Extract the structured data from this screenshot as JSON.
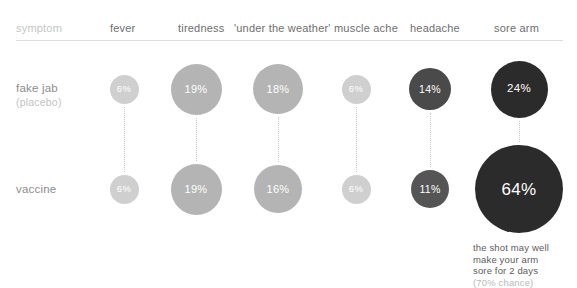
{
  "chart_data": {
    "type": "bar",
    "title": "",
    "subtitle": "",
    "xlabel": "",
    "ylabel": "",
    "legend_position": "left",
    "grid": false,
    "row_header": "symptom",
    "categories": [
      "fever",
      "tiredness",
      "'under the weather'",
      "muscle ache",
      "headache",
      "sore arm"
    ],
    "series": [
      {
        "name": "fake jab",
        "sublabel": "(placebo)",
        "values": [
          6,
          19,
          18,
          6,
          14,
          24
        ],
        "labels": [
          "6%",
          "19%",
          "18%",
          "6%",
          "14%",
          "24%"
        ]
      },
      {
        "name": "vaccine",
        "sublabel": "",
        "values": [
          6,
          19,
          16,
          6,
          11,
          64
        ],
        "labels": [
          "6%",
          "19%",
          "16%",
          "6%",
          "11%",
          "64%"
        ]
      }
    ],
    "units": "percent",
    "annotation": {
      "lines": [
        "the shot may well",
        "make your arm",
        "sore for 2 days"
      ],
      "note": "(70% chance)"
    }
  },
  "colors": {
    "background": "#ffffff",
    "rule": "#dcdcdc",
    "header_text": "#6e6e6e",
    "header_muted": "#c4c4c4",
    "row_label": "#8d8d8d",
    "row_sublabel": "#c2c2c2",
    "connector": "#c9c9c9",
    "bubble_lightest": "#cfcfcf",
    "bubble_light": "#b4b4b4",
    "bubble_mid": "#4a4a4a",
    "bubble_dark": "#2b2b2b",
    "bubble_text": "#ffffff",
    "footnote": "#5c5c5c",
    "footnote_dim": "#b9b9b9"
  },
  "layout": {
    "columns": [
      {
        "key": "fever",
        "header_x": 110,
        "center_x": 124
      },
      {
        "key": "tiredness",
        "header_x": 178,
        "center_x": 196
      },
      {
        "key": "weather",
        "header_x": 234,
        "center_x": 278
      },
      {
        "key": "muscle_ache",
        "header_x": 334,
        "center_x": 356
      },
      {
        "key": "headache",
        "header_x": 410,
        "center_x": 430
      },
      {
        "key": "sore_arm",
        "header_x": 494,
        "center_x": 519
      }
    ],
    "rows": [
      {
        "key": "fake_jab",
        "center_y": 89
      },
      {
        "key": "vaccine",
        "center_y": 189
      }
    ],
    "bubbles": [
      {
        "col": 0,
        "row": 0,
        "d": 29,
        "fill": "#cfcfcf",
        "fs": 9.5
      },
      {
        "col": 1,
        "row": 0,
        "d": 51,
        "fill": "#b4b4b4",
        "fs": 11
      },
      {
        "col": 2,
        "row": 0,
        "d": 50,
        "fill": "#b4b4b4",
        "fs": 11
      },
      {
        "col": 3,
        "row": 0,
        "d": 29,
        "fill": "#cfcfcf",
        "fs": 9.5
      },
      {
        "col": 4,
        "row": 0,
        "d": 42,
        "fill": "#4a4a4a",
        "fs": 10.5
      },
      {
        "col": 5,
        "row": 0,
        "d": 57,
        "fill": "#2b2b2b",
        "fs": 11.5
      },
      {
        "col": 0,
        "row": 1,
        "d": 29,
        "fill": "#cfcfcf",
        "fs": 9.5
      },
      {
        "col": 1,
        "row": 1,
        "d": 51,
        "fill": "#b4b4b4",
        "fs": 11
      },
      {
        "col": 2,
        "row": 1,
        "d": 48,
        "fill": "#b4b4b4",
        "fs": 11
      },
      {
        "col": 3,
        "row": 1,
        "d": 29,
        "fill": "#cfcfcf",
        "fs": 9.5
      },
      {
        "col": 4,
        "row": 1,
        "d": 38,
        "fill": "#555555",
        "fs": 10.5
      },
      {
        "col": 5,
        "row": 1,
        "d": 88,
        "fill": "#2b2b2b",
        "fs": 17
      }
    ]
  }
}
